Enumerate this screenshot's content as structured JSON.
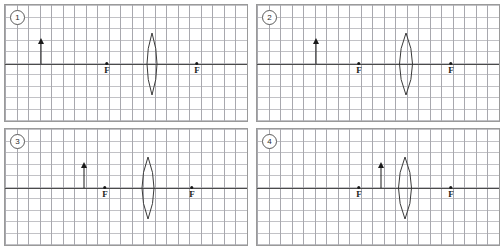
{
  "figure": {
    "grid_cell_px": 11.52,
    "colors": {
      "grid_line": "#b9b9bd",
      "axis_line": "#4a4a4a",
      "frame_border": "#9a9a9a",
      "ink": "#1a1a1a",
      "lens_stroke": "#3a3a3a",
      "background": "#ffffff"
    },
    "focal_label": "F"
  },
  "panels": [
    {
      "number": "1",
      "badge_label": "1",
      "axis_y": 63,
      "lens": {
        "center_x": 151,
        "half_width": 10,
        "half_height": 31
      },
      "focal_points": [
        {
          "label": "F",
          "x": 106,
          "side": "left"
        },
        {
          "label": "F",
          "x": 196,
          "side": "right"
        }
      ],
      "object_arrow": {
        "x": 40,
        "height": 26,
        "direction": "up"
      }
    },
    {
      "number": "2",
      "badge_label": "2",
      "axis_y": 63,
      "lens": {
        "center_x": 405,
        "half_width": 13,
        "half_height": 31
      },
      "focal_points": [
        {
          "label": "F",
          "x": 358,
          "side": "left"
        },
        {
          "label": "F",
          "x": 450,
          "side": "right"
        }
      ],
      "object_arrow": {
        "x": 315,
        "height": 26,
        "direction": "up"
      }
    },
    {
      "number": "3",
      "badge_label": "3",
      "axis_y": 63,
      "lens": {
        "center_x": 147,
        "half_width": 12,
        "half_height": 31
      },
      "focal_points": [
        {
          "label": "F",
          "x": 104,
          "side": "left"
        },
        {
          "label": "F",
          "x": 191,
          "side": "right"
        }
      ],
      "object_arrow": {
        "x": 83,
        "height": 26,
        "direction": "up"
      }
    },
    {
      "number": "4",
      "badge_label": "4",
      "axis_y": 63,
      "lens": {
        "center_x": 404,
        "half_width": 13,
        "half_height": 31
      },
      "focal_points": [
        {
          "label": "F",
          "x": 358,
          "side": "left"
        },
        {
          "label": "F",
          "x": 450,
          "side": "right"
        }
      ],
      "object_arrow": {
        "x": 380,
        "height": 26,
        "direction": "up"
      }
    }
  ]
}
